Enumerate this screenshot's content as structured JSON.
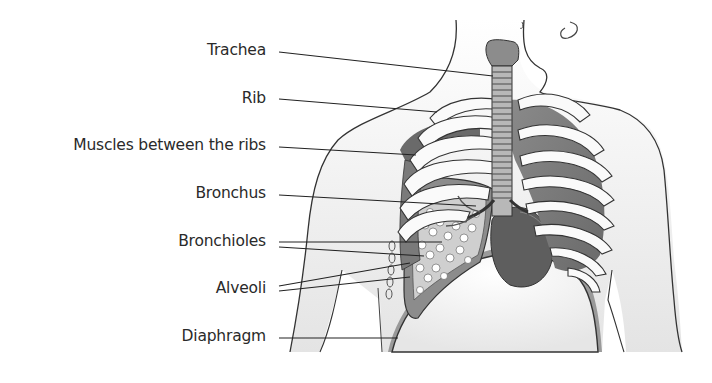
{
  "diagram": {
    "labels": [
      {
        "id": "trachea",
        "text": "Trachea"
      },
      {
        "id": "rib",
        "text": "Rib"
      },
      {
        "id": "muscles",
        "text": "Muscles between the ribs"
      },
      {
        "id": "bronchus",
        "text": "Bronchus"
      },
      {
        "id": "bronchioles",
        "text": "Bronchioles"
      },
      {
        "id": "alveoli",
        "text": "Alveoli"
      },
      {
        "id": "diaphragm",
        "text": "Diaphragm"
      }
    ],
    "colors": {
      "text": "#2a2a2a",
      "leader_line": "#222222",
      "outline": "#333333",
      "skin_fill": "#f2f2f2",
      "organ_dark": "#6e6e6e",
      "organ_mid": "#9a9a9a",
      "bone": "#fafafa"
    }
  }
}
